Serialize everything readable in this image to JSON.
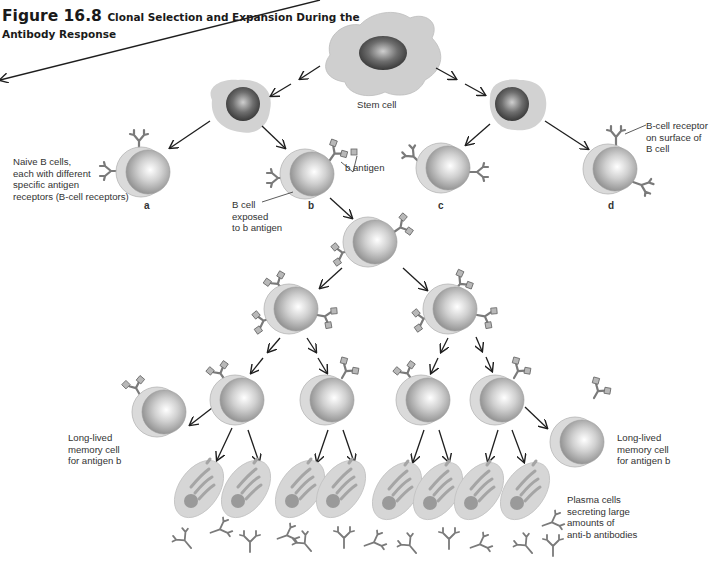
{
  "figure": {
    "number": "Figure 16.8",
    "caption_line1": "Clonal Selection and Expansion During the",
    "caption_line2": "Antibody Response"
  },
  "labels": {
    "stem_cell": "Stem cell",
    "naive_b_cells": "Naive B cells,\neach with different\nspecific antigen\nreceptors (B-cell receptors)",
    "b_antigen": "b antigen",
    "b_cell_exposed": "B cell\nexposed\nto b antigen",
    "bcr_on_surface": "B-cell receptor\non surface of\nB cell",
    "memory_left": "Long-lived\nmemory cell\nfor antigen b",
    "memory_right": "Long-lived\nmemory cell\nfor antigen b",
    "plasma_cells": "Plasma cells\nsecreting large\namounts of\nanti-b antibodies"
  },
  "cell_letters": [
    "a",
    "b",
    "c",
    "d"
  ],
  "colors": {
    "cell_fill": "#bdbdbd",
    "cell_shell": "#d9d9d9",
    "nucleus_dark": "#5a5a5a",
    "plasma_fill": "#d6d6d6",
    "antibody": "#7a7a7a",
    "arrow": "#1e1e1e"
  }
}
